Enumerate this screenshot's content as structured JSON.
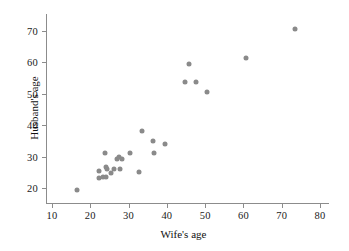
{
  "chart_data": {
    "type": "scatter",
    "title": "",
    "xlabel": "Wife's age",
    "ylabel": "Husband's age",
    "xlim": [
      6,
      84
    ],
    "ylim": [
      16.5,
      74
    ],
    "xticks": [
      10,
      20,
      30,
      40,
      50,
      60,
      70,
      80
    ],
    "yticks": [
      20,
      30,
      40,
      50,
      60,
      70
    ],
    "grid": false,
    "legend": null,
    "marker": {
      "shape": "circle",
      "color": "#8a8a8a",
      "size_px": 5
    },
    "points": [
      {
        "x": 16.4,
        "y": 19.5
      },
      {
        "x": 22.2,
        "y": 25.3
      },
      {
        "x": 22.4,
        "y": 23.2
      },
      {
        "x": 23.3,
        "y": 23.4
      },
      {
        "x": 23.9,
        "y": 31.3
      },
      {
        "x": 24.0,
        "y": 23.4
      },
      {
        "x": 24.1,
        "y": 26.7
      },
      {
        "x": 24.3,
        "y": 25.9
      },
      {
        "x": 25.3,
        "y": 24.9
      },
      {
        "x": 26.3,
        "y": 26.0
      },
      {
        "x": 27.0,
        "y": 29.2
      },
      {
        "x": 27.5,
        "y": 29.9
      },
      {
        "x": 27.7,
        "y": 26.1
      },
      {
        "x": 28.4,
        "y": 29.1
      },
      {
        "x": 30.5,
        "y": 31.1
      },
      {
        "x": 32.6,
        "y": 25.1
      },
      {
        "x": 33.6,
        "y": 38.3
      },
      {
        "x": 36.4,
        "y": 34.9
      },
      {
        "x": 36.7,
        "y": 31.0
      },
      {
        "x": 39.6,
        "y": 33.9
      },
      {
        "x": 44.7,
        "y": 53.6
      },
      {
        "x": 45.7,
        "y": 59.4
      },
      {
        "x": 47.6,
        "y": 53.6
      },
      {
        "x": 50.5,
        "y": 50.6
      },
      {
        "x": 60.7,
        "y": 61.4
      },
      {
        "x": 73.6,
        "y": 70.6
      }
    ],
    "n_points": 26,
    "relationship": "positive linear association"
  }
}
